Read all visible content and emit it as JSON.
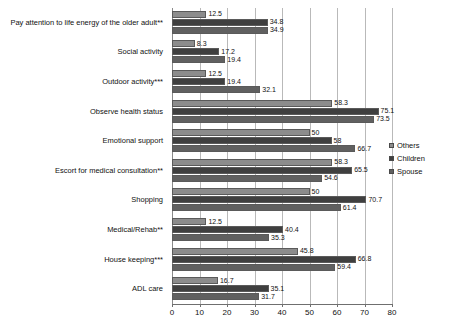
{
  "chart_data": {
    "type": "bar",
    "orientation": "horizontal",
    "title": "",
    "subtitle": "",
    "xlabel": "",
    "ylabel": "",
    "xlim": [
      0,
      80
    ],
    "xticks": [
      0,
      10,
      20,
      30,
      40,
      50,
      60,
      70,
      80
    ],
    "grid": true,
    "legend_position": "right",
    "categories": [
      "Pay attention to life energy of the older adult**",
      "Social activity",
      "Outdoor activity***",
      "Observe health status",
      "Emotional support",
      "Escort for medical consultation**",
      "Shopping",
      "Medical/Rehab**",
      "House keeping***",
      "ADL care"
    ],
    "series": [
      {
        "name": "Others",
        "color": "#8c8c8c",
        "values": [
          12.5,
          8.3,
          12.5,
          58.3,
          50,
          58.3,
          50,
          12.5,
          45.8,
          16.7
        ],
        "labels": [
          "12.5",
          "8.3",
          "12.5",
          "58.3",
          "50",
          "58.3",
          "50",
          "12.5",
          "45.8",
          "16.7"
        ]
      },
      {
        "name": "Children",
        "color": "#3f3f3f",
        "values": [
          34.8,
          17.2,
          19.4,
          75.1,
          58,
          65.5,
          70.7,
          40.4,
          66.8,
          35.1
        ],
        "labels": [
          "34.8",
          "17.2",
          "19.4",
          "75.1",
          "58",
          "65.5",
          "70.7",
          "40.4",
          "66.8",
          "35.1"
        ]
      },
      {
        "name": "Spouse",
        "color": "#606060",
        "values": [
          34.9,
          19.4,
          32.1,
          73.5,
          66.7,
          54.6,
          61.4,
          35.3,
          59.4,
          31.7
        ],
        "labels": [
          "34.9",
          "19.4",
          "32.1",
          "73.5",
          "66.7",
          "54.6",
          "61.4",
          "35.3",
          "59.4",
          "31.7"
        ]
      }
    ]
  },
  "legend": {
    "items": [
      {
        "label": "Others",
        "color": "#8c8c8c"
      },
      {
        "label": "Children",
        "color": "#3f3f3f"
      },
      {
        "label": "Spouse",
        "color": "#606060"
      }
    ]
  },
  "axis": {
    "tick_labels": [
      "0",
      "10",
      "20",
      "30",
      "40",
      "50",
      "60",
      "70",
      "80"
    ]
  }
}
